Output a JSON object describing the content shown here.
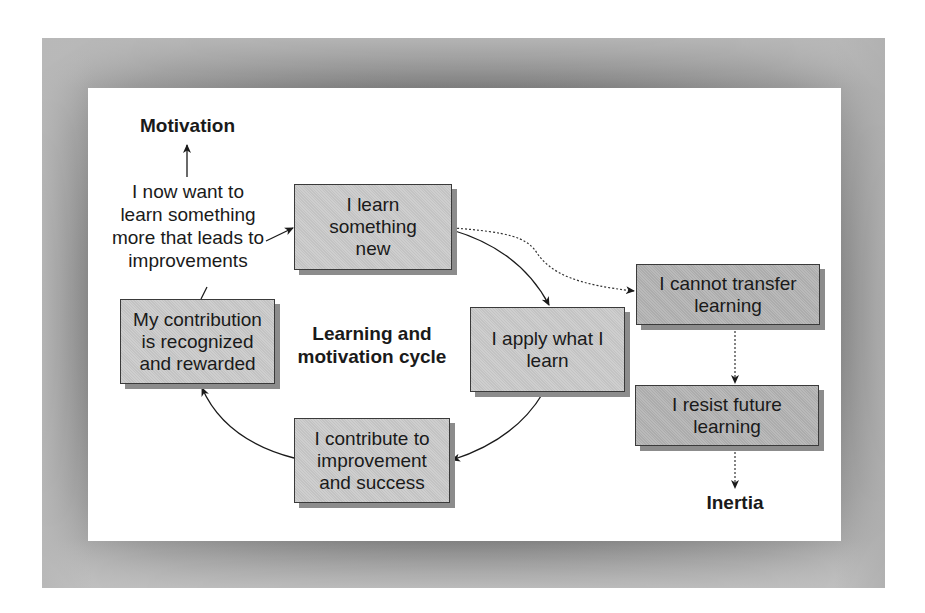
{
  "diagram": {
    "title": "Learning and motivation cycle",
    "top_label": "Motivation",
    "bottom_label": "Inertia",
    "motivation_text": "I now want to learn something more that leads to improvements",
    "motivation_text_lines": [
      "I now want to",
      "learn something",
      "more that leads to",
      "improvements"
    ],
    "cycle_nodes": [
      {
        "id": "learn",
        "label": "I learn something new"
      },
      {
        "id": "apply",
        "label": "I apply what I learn"
      },
      {
        "id": "contribute",
        "label": "I contribute to improvement and success"
      },
      {
        "id": "recognized",
        "label": "My contribution is recognized and rewarded"
      }
    ],
    "inertia_nodes": [
      {
        "id": "cannot-transfer",
        "label": "I cannot transfer learning"
      },
      {
        "id": "resist",
        "label": "I resist future learning"
      }
    ],
    "edges": [
      {
        "from": "learn",
        "to": "apply",
        "style": "solid"
      },
      {
        "from": "apply",
        "to": "contribute",
        "style": "solid"
      },
      {
        "from": "contribute",
        "to": "recognized",
        "style": "solid"
      },
      {
        "from": "recognized",
        "to": "motivation_text",
        "style": "solid-line"
      },
      {
        "from": "motivation_text",
        "to": "learn",
        "style": "solid"
      },
      {
        "from": "motivation_text",
        "to": "top_label",
        "style": "solid"
      },
      {
        "from": "learn",
        "to": "cannot-transfer",
        "style": "dotted"
      },
      {
        "from": "cannot-transfer",
        "to": "resist",
        "style": "dotted"
      },
      {
        "from": "resist",
        "to": "bottom_label",
        "style": "dotted"
      }
    ],
    "colors": {
      "cycle_box_fill": "#c9c9c9",
      "inertia_box_fill": "#b2b2b2",
      "box_border": "#3a3a3a",
      "box_shadow": "#8c8c8c",
      "frame": "#7a7a7a",
      "text": "#1a1a1a"
    }
  }
}
